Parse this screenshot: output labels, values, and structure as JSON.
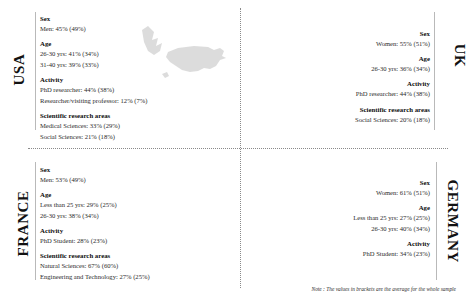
{
  "footnote": "Note : The values in brackets are the average for the whole sample",
  "section_labels": {
    "sex": "Sex",
    "age": "Age",
    "activity": "Activity",
    "research": "Scientific research areas"
  },
  "panels": {
    "usa": {
      "country": "USA",
      "map_icon": "usa-map-icon",
      "sex": [
        "Men: 45% (49%)"
      ],
      "age": [
        "26-30 yrs: 41% (34%)",
        "31-40 yrs: 39% (33%)"
      ],
      "activity": [
        "PhD researcher: 44% (38%)",
        "Researcher/visiting professor: 12% (7%)"
      ],
      "research": [
        "Medical Sciences: 33% (29%)",
        "Social Sciences: 21% (18%)"
      ]
    },
    "uk": {
      "country": "UK",
      "map_icon": "uk-map-icon",
      "sex": [
        "Women: 55% (51%)"
      ],
      "age": [
        "26-30 yrs: 36% (34%)"
      ],
      "activity": [
        "PhD researcher: 44% (38%)"
      ],
      "research": [
        "Social Sciences: 20% (18%)"
      ]
    },
    "france": {
      "country": "FRANCE",
      "map_icon": "france-map-icon",
      "sex": [
        "Men: 53% (49%)"
      ],
      "age": [
        "Less than 25 yrs: 29% (25%)",
        "26-30 yrs: 38% (34%)"
      ],
      "activity": [
        "PhD Student: 28% (23%)"
      ],
      "research": [
        "Natural Sciences: 67% (60%)",
        "Engineering and Technology: 27% (25%)"
      ]
    },
    "germany": {
      "country": "GERMANY",
      "map_icon": "germany-map-icon",
      "sex": [
        "Women: 61% (51%)"
      ],
      "age": [
        "Less than 25 yrs: 27% (25%)",
        "26-30 yrs: 40% (34%)"
      ],
      "activity": [
        "PhD Student: 34% (23%)"
      ],
      "research": []
    }
  }
}
